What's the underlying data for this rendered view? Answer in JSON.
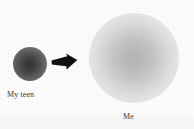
{
  "figure": {
    "type": "concept-diagram",
    "background_color": "#fcfcfc",
    "nodes": [
      {
        "id": "teen",
        "label": "My teen",
        "shape": "sphere",
        "diameter_px": 34,
        "center_color": "#343434",
        "edge_color": "#c8c8c8",
        "label_position": "below"
      },
      {
        "id": "me",
        "label": "Me",
        "shape": "sphere",
        "diameter_px": 90,
        "center_color": "#b4b4b4",
        "edge_color": "#cdcdcd",
        "label_position": "below"
      }
    ],
    "connector": {
      "kind": "arrow",
      "direction": "right",
      "color": "#111111",
      "from": "teen",
      "to": "me"
    }
  }
}
